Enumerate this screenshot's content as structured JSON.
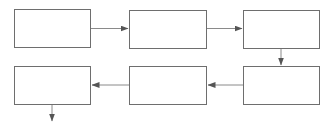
{
  "diagram": {
    "type": "flowchart",
    "layout": "serpentine 3x2",
    "colors": {
      "stroke": "#6e6e6e",
      "arrow": "#8a8a8a",
      "arrowhead": "#555555",
      "background": "#ffffff"
    },
    "nodes": [
      {
        "id": "box-1",
        "label": "",
        "row": 1,
        "col": 1
      },
      {
        "id": "box-2",
        "label": "",
        "row": 1,
        "col": 2
      },
      {
        "id": "box-3",
        "label": "",
        "row": 1,
        "col": 3
      },
      {
        "id": "box-4",
        "label": "",
        "row": 2,
        "col": 3
      },
      {
        "id": "box-5",
        "label": "",
        "row": 2,
        "col": 2
      },
      {
        "id": "box-6",
        "label": "",
        "row": 2,
        "col": 1
      }
    ],
    "edges": [
      {
        "from": "box-1",
        "to": "box-2",
        "direction": "right"
      },
      {
        "from": "box-2",
        "to": "box-3",
        "direction": "right"
      },
      {
        "from": "box-3",
        "to": "box-4",
        "direction": "down"
      },
      {
        "from": "box-4",
        "to": "box-5",
        "direction": "left"
      },
      {
        "from": "box-5",
        "to": "box-6",
        "direction": "left"
      },
      {
        "from": "box-6",
        "to": "exit",
        "direction": "down"
      }
    ]
  }
}
